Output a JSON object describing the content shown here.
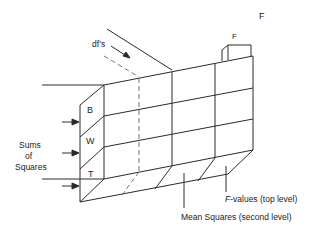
{
  "diagram": {
    "type": "3d-block-schematic",
    "labels": {
      "dfs": "df’s",
      "sums_line1": "Sums",
      "sums_line2": "of",
      "sums_line3": "Squares",
      "f_top": "F",
      "f_small": "F",
      "f_values": "F-values (top level)",
      "f_values_italic": "F",
      "f_values_rest": "-values (top level)",
      "mean_squares": "Mean Squares (second level)"
    },
    "rows": [
      {
        "label": "B"
      },
      {
        "label": "W"
      },
      {
        "label": "T"
      }
    ],
    "colors": {
      "stroke": "#2a2a2a",
      "dashed": "#777777",
      "text": "#222222",
      "background": "#ffffff"
    }
  }
}
